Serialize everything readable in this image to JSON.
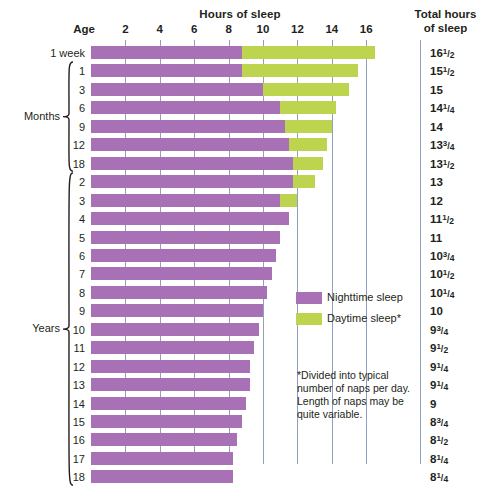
{
  "header": {
    "hours_title": "Hours of sleep",
    "total_title_line1": "Total hours",
    "total_title_line2": "of sleep",
    "age_title": "Age"
  },
  "axis": {
    "xlabel": "Hours of sleep",
    "ticks": [
      2,
      4,
      6,
      8,
      10,
      12,
      14,
      16
    ],
    "min": 0,
    "max": 17.5
  },
  "groups": [
    {
      "name": "",
      "label": ""
    },
    {
      "name": "months",
      "label": "Months"
    },
    {
      "name": "years",
      "label": "Years"
    }
  ],
  "legend": {
    "items": [
      {
        "label": "Nighttime sleep",
        "color": "#a971b5",
        "key": "night"
      },
      {
        "label": "Daytime sleep*",
        "color": "#bcd44e",
        "key": "day"
      }
    ]
  },
  "footnote": "*Divided into typical number of naps per day. Length of naps may be quite variable.",
  "colors": {
    "night": "#a971b5",
    "day": "#bcd44e",
    "gridline": "#8f9fc4",
    "text": "#231f20",
    "background": "#ffffff"
  },
  "chart_data": {
    "type": "bar",
    "orientation": "horizontal",
    "stacked": true,
    "title": "Hours of sleep",
    "xlabel": "Hours of sleep",
    "ylabel": "Age",
    "xlim": [
      0,
      17.5
    ],
    "xticks": [
      2,
      4,
      6,
      8,
      10,
      12,
      14,
      16
    ],
    "grid": true,
    "legend_position": "center-right",
    "categories": [
      "1 week",
      "1",
      "3",
      "6",
      "9",
      "12",
      "18",
      "2",
      "3",
      "4",
      "5",
      "6",
      "7",
      "8",
      "9",
      "10",
      "11",
      "12",
      "13",
      "14",
      "15",
      "16",
      "17",
      "18"
    ],
    "series": [
      {
        "name": "Nighttime sleep",
        "color": "#a971b5",
        "values": [
          8.75,
          8.75,
          10.0,
          11.0,
          11.25,
          11.5,
          11.75,
          11.75,
          11.0,
          11.5,
          11.0,
          10.75,
          10.5,
          10.25,
          10.0,
          9.75,
          9.5,
          9.25,
          9.25,
          9.0,
          8.75,
          8.5,
          8.25,
          8.25
        ]
      },
      {
        "name": "Daytime sleep*",
        "color": "#bcd44e",
        "values": [
          7.75,
          6.75,
          5.0,
          3.25,
          2.75,
          2.25,
          1.75,
          1.25,
          1.0,
          0,
          0,
          0,
          0,
          0,
          0,
          0,
          0,
          0,
          0,
          0,
          0,
          0,
          0,
          0
        ]
      }
    ],
    "rows": [
      {
        "age": "1 week",
        "group": "",
        "night": 8.75,
        "day": 7.75,
        "total": "16",
        "total_num": "1",
        "total_den": "2"
      },
      {
        "age": "1",
        "group": "months",
        "night": 8.75,
        "day": 6.75,
        "total": "15",
        "total_num": "1",
        "total_den": "2"
      },
      {
        "age": "3",
        "group": "months",
        "night": 10.0,
        "day": 5.0,
        "total": "15",
        "total_num": "",
        "total_den": ""
      },
      {
        "age": "6",
        "group": "months",
        "night": 11.0,
        "day": 3.25,
        "total": "14",
        "total_num": "1",
        "total_den": "4"
      },
      {
        "age": "9",
        "group": "months",
        "night": 11.25,
        "day": 2.75,
        "total": "14",
        "total_num": "",
        "total_den": ""
      },
      {
        "age": "12",
        "group": "months",
        "night": 11.5,
        "day": 2.25,
        "total": "13",
        "total_num": "3",
        "total_den": "4"
      },
      {
        "age": "18",
        "group": "months",
        "night": 11.75,
        "day": 1.75,
        "total": "13",
        "total_num": "1",
        "total_den": "2"
      },
      {
        "age": "2",
        "group": "years",
        "night": 11.75,
        "day": 1.25,
        "total": "13",
        "total_num": "",
        "total_den": ""
      },
      {
        "age": "3",
        "group": "years",
        "night": 11.0,
        "day": 1.0,
        "total": "12",
        "total_num": "",
        "total_den": ""
      },
      {
        "age": "4",
        "group": "years",
        "night": 11.5,
        "day": 0,
        "total": "11",
        "total_num": "1",
        "total_den": "2"
      },
      {
        "age": "5",
        "group": "years",
        "night": 11.0,
        "day": 0,
        "total": "11",
        "total_num": "",
        "total_den": ""
      },
      {
        "age": "6",
        "group": "years",
        "night": 10.75,
        "day": 0,
        "total": "10",
        "total_num": "3",
        "total_den": "4"
      },
      {
        "age": "7",
        "group": "years",
        "night": 10.5,
        "day": 0,
        "total": "10",
        "total_num": "1",
        "total_den": "2"
      },
      {
        "age": "8",
        "group": "years",
        "night": 10.25,
        "day": 0,
        "total": "10",
        "total_num": "1",
        "total_den": "4"
      },
      {
        "age": "9",
        "group": "years",
        "night": 10.0,
        "day": 0,
        "total": "10",
        "total_num": "",
        "total_den": ""
      },
      {
        "age": "10",
        "group": "years",
        "night": 9.75,
        "day": 0,
        "total": "9",
        "total_num": "3",
        "total_den": "4"
      },
      {
        "age": "11",
        "group": "years",
        "night": 9.5,
        "day": 0,
        "total": "9",
        "total_num": "1",
        "total_den": "2"
      },
      {
        "age": "12",
        "group": "years",
        "night": 9.25,
        "day": 0,
        "total": "9",
        "total_num": "1",
        "total_den": "4"
      },
      {
        "age": "13",
        "group": "years",
        "night": 9.25,
        "day": 0,
        "total": "9",
        "total_num": "1",
        "total_den": "4"
      },
      {
        "age": "14",
        "group": "years",
        "night": 9.0,
        "day": 0,
        "total": "9",
        "total_num": "",
        "total_den": ""
      },
      {
        "age": "15",
        "group": "years",
        "night": 8.75,
        "day": 0,
        "total": "8",
        "total_num": "3",
        "total_den": "4"
      },
      {
        "age": "16",
        "group": "years",
        "night": 8.5,
        "day": 0,
        "total": "8",
        "total_num": "1",
        "total_den": "2"
      },
      {
        "age": "17",
        "group": "years",
        "night": 8.25,
        "day": 0,
        "total": "8",
        "total_num": "1",
        "total_den": "4"
      },
      {
        "age": "18",
        "group": "years",
        "night": 8.25,
        "day": 0,
        "total": "8",
        "total_num": "1",
        "total_den": "4"
      }
    ]
  },
  "layout": {
    "x0": 91,
    "px_per_hour": 17.2,
    "row_top": 46,
    "row_pitch": 18.45,
    "bar_height": 13
  }
}
